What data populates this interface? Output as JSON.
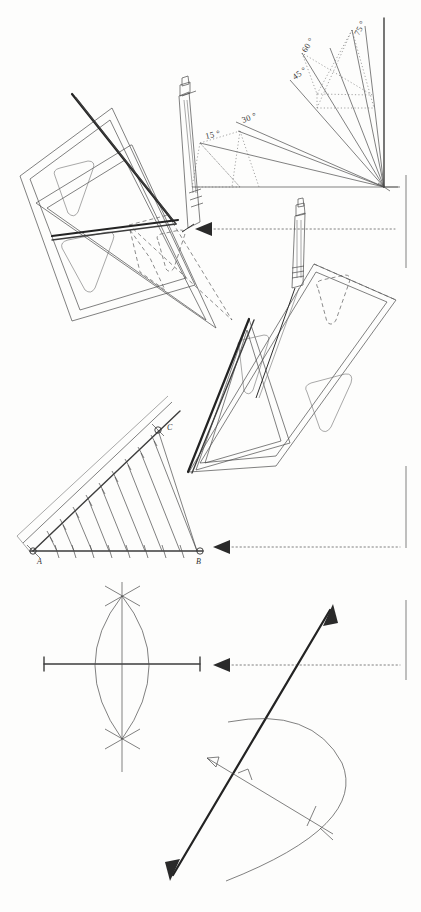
{
  "page": {
    "background_color": "#fdfdfc",
    "ink_color": "#3a3a3a",
    "width": 421,
    "height": 912
  },
  "angle_fan": {
    "caption": "",
    "vertex_label": "",
    "labels": [
      {
        "text": "15 °",
        "value": 15,
        "x": 206,
        "y": 139,
        "rotate": -13
      },
      {
        "text": "30 °",
        "value": 30,
        "x": 243,
        "y": 129,
        "rotate": -22
      },
      {
        "text": "45 °",
        "value": 45,
        "x": 297,
        "y": 78,
        "rotate": -37
      },
      {
        "text": "60 °",
        "value": 60,
        "x": 311,
        "y": 50,
        "rotate": -58
      },
      {
        "text": "75 °",
        "value": 75,
        "x": 361,
        "y": 34,
        "rotate": -66
      }
    ],
    "ray_values": [
      15,
      30,
      45,
      60,
      75,
      90
    ],
    "baseline_text": "0"
  },
  "construction_ab": {
    "point_a_label": "A",
    "point_b_label": "B",
    "point_c_label": "C",
    "division_count": 10,
    "description": "Dividing a line into equal parts"
  },
  "markers": {
    "arrow_1_label": "step-1-pointer",
    "arrow_2_label": "step-2-pointer",
    "arrow_3_label": "step-3-pointer"
  },
  "panels": {
    "top_left": "set-squares-sliding-pencil",
    "top_right": "angle-fan-15-to-90",
    "middle": "set-squares-parallel-transfer",
    "middle_left": "equal-division-of-segment",
    "bottom_left": "perpendicular-bisector-arcs",
    "bottom_right": "perpendicular-through-point-arc"
  }
}
